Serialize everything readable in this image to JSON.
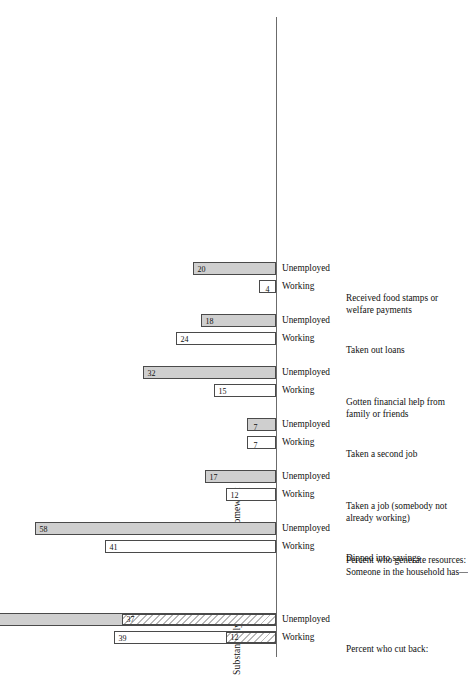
{
  "figure": {
    "value_axis_labels": [
      "Substantially",
      "Somewhat"
    ],
    "series_labels": [
      "Working",
      "Unemployed"
    ],
    "section_headers": [
      "Percent who cut back:",
      "Percent who generate resources:\nSomeone in the household has—"
    ]
  },
  "chart_data": {
    "type": "bar",
    "title": "",
    "orientation": "vertical-bars-on-rotated-page",
    "xlabel": "",
    "ylabel": "Percent",
    "ylim": [
      0,
      62
    ],
    "grid": false,
    "legend": [
      "Substantially",
      "Somewhat"
    ],
    "legend_position": "value-axis-annotation",
    "categories": [
      "Percent who cut back:",
      "Dipped into savings",
      "Taken a job (somebody not already working)",
      "Taken a second job",
      "Gotten financial help from family or friends",
      "Taken out loans",
      "Received food stamps or welfare payments"
    ],
    "series": [
      {
        "name": "Working",
        "values": [
          39,
          41,
          12,
          7,
          15,
          24,
          4
        ]
      },
      {
        "name": "Unemployed",
        "values": [
          79,
          58,
          17,
          7,
          32,
          18,
          20
        ]
      }
    ],
    "stacked_detail": {
      "note": "Row 1 bars are split into Substantially / Somewhat segments",
      "rows": [
        {
          "category": "Percent who cut back:",
          "bars": [
            {
              "series": "Working",
              "total": 39,
              "segments": [
                {
                  "label": "Substantially",
                  "value": 12
                },
                {
                  "label": "Somewhat",
                  "value": 27
                }
              ]
            },
            {
              "series": "Unemployed",
              "total": 79,
              "segments": [
                {
                  "label": "Substantially",
                  "value": 37
                },
                {
                  "label": "Somewhat",
                  "value": 42
                }
              ]
            }
          ]
        }
      ]
    },
    "bars": [
      {
        "row": "Percent who cut back:",
        "series": "Working",
        "value": 39,
        "displayed_label": "39",
        "style": "open-with-hatched-base",
        "base_label": "12"
      },
      {
        "row": "Percent who cut back:",
        "series": "Unemployed",
        "value": 79,
        "displayed_label": "42",
        "style": "filled-with-hatched-base",
        "base_label": "37"
      },
      {
        "row": "Dipped into savings",
        "series": "Working",
        "value": 41,
        "displayed_label": "41",
        "style": "open"
      },
      {
        "row": "Dipped into savings",
        "series": "Unemployed",
        "value": 58,
        "displayed_label": "58",
        "style": "filled"
      },
      {
        "row": "Taken a job (somebody not already working)",
        "series": "Working",
        "value": 12,
        "displayed_label": "12",
        "style": "open"
      },
      {
        "row": "Taken a job (somebody not already working)",
        "series": "Unemployed",
        "value": 17,
        "displayed_label": "17",
        "style": "filled"
      },
      {
        "row": "Taken a second job",
        "series": "Working",
        "value": 7,
        "displayed_label": "7",
        "style": "open"
      },
      {
        "row": "Taken a second job",
        "series": "Unemployed",
        "value": 7,
        "displayed_label": "7",
        "style": "filled"
      },
      {
        "row": "Gotten financial help from family or friends",
        "series": "Working",
        "value": 15,
        "displayed_label": "15",
        "style": "open"
      },
      {
        "row": "Gotten financial help from family or friends",
        "series": "Unemployed",
        "value": 32,
        "displayed_label": "32",
        "style": "filled"
      },
      {
        "row": "Taken out loans",
        "series": "Working",
        "value": 24,
        "displayed_label": "24",
        "style": "open"
      },
      {
        "row": "Taken out loans",
        "series": "Unemployed",
        "value": 18,
        "displayed_label": "18",
        "style": "filled"
      },
      {
        "row": "Received food stamps or welfare payments",
        "series": "Working",
        "value": 4,
        "displayed_label": "4",
        "style": "open"
      },
      {
        "row": "Received food stamps or welfare payments",
        "series": "Unemployed",
        "value": 20,
        "displayed_label": "20",
        "style": "filled"
      }
    ],
    "colors": {
      "open_bar_fill": "#ffffff",
      "filled_bar_fill": "#cfcfcf",
      "hatch_stroke": "#b9b9b9",
      "bar_outline": "#4a4a4a",
      "text": "#111111",
      "background": "#ffffff"
    }
  },
  "rows": [
    {
      "label": "Percent who cut back:",
      "is_header": true
    },
    {
      "label": "Percent who generate resources:\nSomeone in the household has—",
      "is_header": true
    },
    {
      "label": "Dipped into savings",
      "is_header": false
    },
    {
      "label": "Taken a job (somebody not\nalready working)",
      "is_header": false
    },
    {
      "label": "Taken a second job",
      "is_header": false
    },
    {
      "label": "Gotten financial help from\nfamily or friends",
      "is_header": false
    },
    {
      "label": "Taken out loans",
      "is_header": false
    },
    {
      "label": "Received food stamps or\nwelfare payments",
      "is_header": false
    }
  ]
}
